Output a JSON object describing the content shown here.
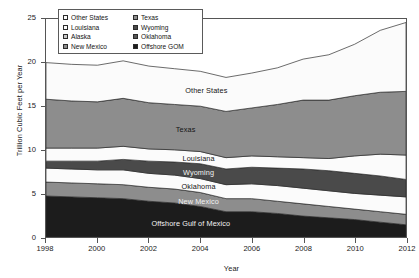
{
  "chart_data": {
    "type": "area",
    "title": "",
    "xlabel": "Year",
    "ylabel": "Trillion Cubic Feet per Year",
    "xlim": [
      1998,
      2012
    ],
    "ylim": [
      0,
      25
    ],
    "grid": false,
    "stacked": true,
    "legend_position": "top-left-inside",
    "xticks": [
      "1998",
      "2000",
      "2002",
      "2004",
      "2006",
      "2008",
      "2010",
      "2012"
    ],
    "yticks": [
      "0",
      "5",
      "10",
      "15",
      "20",
      "25"
    ],
    "x": [
      1998,
      1999,
      2000,
      2001,
      2002,
      2003,
      2004,
      2005,
      2006,
      2007,
      2008,
      2009,
      2010,
      2011,
      2012
    ],
    "series": [
      {
        "name": "Offshore Gulf of Mexico",
        "color": "#1c1c1c",
        "label_in_plot": "Offshore Gulf of Mexico",
        "values": [
          4.7,
          4.6,
          4.5,
          4.4,
          4.1,
          3.9,
          3.5,
          2.9,
          2.9,
          2.7,
          2.4,
          2.2,
          2.0,
          1.7,
          1.4
        ]
      },
      {
        "name": "New Mexico",
        "color": "#8d8d8d",
        "label_in_plot": "New Mexico",
        "values": [
          1.6,
          1.6,
          1.6,
          1.6,
          1.6,
          1.6,
          1.6,
          1.5,
          1.5,
          1.4,
          1.4,
          1.3,
          1.2,
          1.2,
          1.2
        ]
      },
      {
        "name": "Oklahoma",
        "color": "#fbfbfb",
        "label_in_plot": "Oklahoma",
        "values": [
          1.6,
          1.6,
          1.6,
          1.7,
          1.6,
          1.6,
          1.6,
          1.6,
          1.7,
          1.8,
          1.8,
          1.8,
          1.8,
          1.9,
          2.0
        ]
      },
      {
        "name": "Wyoming",
        "color": "#4a4a4a",
        "label_in_plot": "Wyoming",
        "values": [
          0.8,
          0.9,
          1.0,
          1.2,
          1.4,
          1.5,
          1.7,
          1.8,
          1.9,
          2.0,
          2.2,
          2.3,
          2.3,
          2.2,
          2.0
        ]
      },
      {
        "name": "Louisiana",
        "color": "#fbfbfb",
        "label_in_plot": "Louisiana",
        "values": [
          1.5,
          1.5,
          1.5,
          1.5,
          1.4,
          1.4,
          1.4,
          1.3,
          1.3,
          1.3,
          1.3,
          1.4,
          2.0,
          2.5,
          2.8
        ]
      },
      {
        "name": "Texas",
        "color": "#8d8d8d",
        "label_in_plot": "Texas",
        "values": [
          5.6,
          5.4,
          5.3,
          5.5,
          5.3,
          5.2,
          5.2,
          5.3,
          5.5,
          6.0,
          6.6,
          6.7,
          6.9,
          7.1,
          7.3
        ]
      },
      {
        "name": "Other States",
        "color": "#fbfbfb",
        "label_in_plot": "Other States",
        "values": [
          4.2,
          4.2,
          4.2,
          4.3,
          4.2,
          4.1,
          4.0,
          3.9,
          4.0,
          4.2,
          4.7,
          5.2,
          5.9,
          7.1,
          7.9
        ]
      }
    ],
    "total_by_year": [
      20.0,
      19.8,
      19.7,
      20.2,
      19.6,
      19.3,
      19.0,
      18.3,
      18.8,
      19.4,
      20.4,
      20.9,
      22.1,
      23.7,
      24.6
    ]
  },
  "legend": {
    "items": [
      {
        "label": "Other States",
        "color": "#fbfbfb"
      },
      {
        "label": "Texas",
        "color": "#8d8d8d"
      },
      {
        "label": "Louisiana",
        "color": "#fbfbfb"
      },
      {
        "label": "Wyoming",
        "color": "#4a4a4a"
      },
      {
        "label": "Alaska",
        "color": "#c9c9c9"
      },
      {
        "label": "Oklahoma",
        "color": "#555555"
      },
      {
        "label": "New Mexico",
        "color": "#8d8d8d"
      },
      {
        "label": "Offshore GOM",
        "color": "#1c1c1c"
      }
    ]
  }
}
